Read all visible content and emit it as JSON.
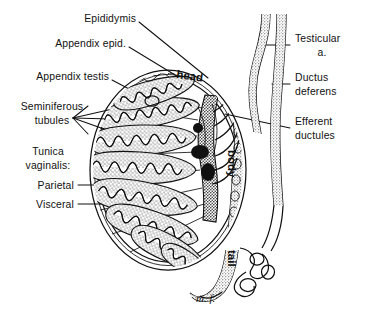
{
  "figure": {
    "background_color": "#ffffff",
    "ink_color": "#111111",
    "signature": "m. f."
  },
  "labels_left": [
    {
      "id": "epididymis",
      "text": "Epididymis",
      "line2": ""
    },
    {
      "id": "appendix-epid",
      "text": "Appendix epid.",
      "line2": ""
    },
    {
      "id": "appendix-testis",
      "text": "Appendix testis",
      "line2": ""
    },
    {
      "id": "seminiferous",
      "text": "Seminiferous",
      "line2": "tubules"
    },
    {
      "id": "tunica",
      "text": "Tunica",
      "line2": "vaginalis:"
    },
    {
      "id": "parietal",
      "text": "Parietal",
      "line2": ""
    },
    {
      "id": "visceral",
      "text": "Visceral",
      "line2": ""
    }
  ],
  "labels_right": [
    {
      "id": "testicular-a",
      "text": "Testicular",
      "line2": "a."
    },
    {
      "id": "ductus",
      "text": "Ductus",
      "line2": "deferens"
    },
    {
      "id": "efferent",
      "text": "Efferent",
      "line2": "ductules"
    }
  ],
  "embedded_text": [
    {
      "id": "head",
      "text": "head"
    },
    {
      "id": "body",
      "text": "body"
    },
    {
      "id": "tail",
      "text": "tail"
    }
  ],
  "structures": {
    "testis": "oval body with radiating lobules",
    "lobule_count": 9,
    "mediastinum": "central rete testis",
    "epididymis_parts": [
      "head",
      "body",
      "tail"
    ],
    "cords": [
      "testicular artery",
      "ductus deferens"
    ]
  }
}
